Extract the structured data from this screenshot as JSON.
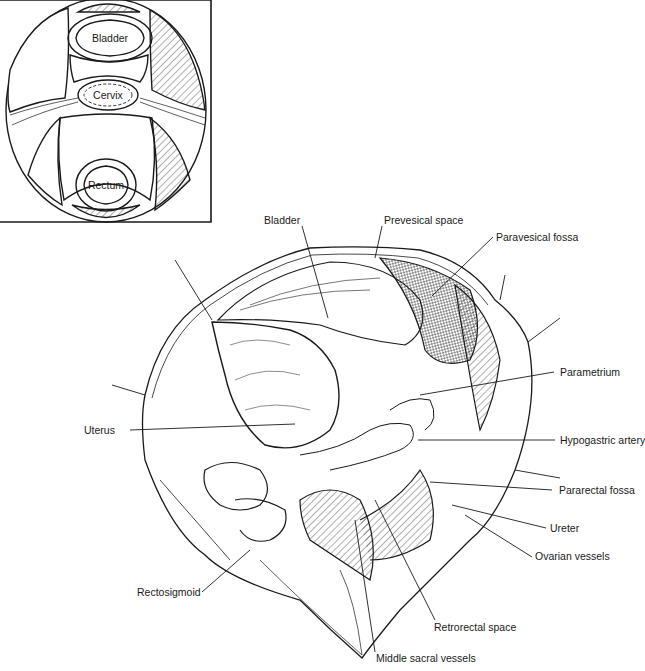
{
  "figure": {
    "type": "anatomical-illustration",
    "ink_color": "#1a1a1a",
    "background": "#ffffff"
  },
  "inset": {
    "title": "",
    "labels": {
      "bladder": "Bladder",
      "cervix": "Cervix",
      "rectum": "Rectum"
    }
  },
  "labels": {
    "bladder": "Bladder",
    "prevesical_space": "Prevesical space",
    "paravesical_fossa": "Paravesical fossa",
    "parametrium": "Parametrium",
    "uterus": "Uterus",
    "hypogastric_artery": "Hypogastric artery",
    "pararectal_fossa": "Pararectal fossa",
    "ureter": "Ureter",
    "ovarian_vessels": "Ovarian vessels",
    "rectosigmoid": "Rectosigmoid",
    "retrorectal_space": "Retrorectal space",
    "middle_sacral_vessels": "Middle sacral vessels"
  }
}
